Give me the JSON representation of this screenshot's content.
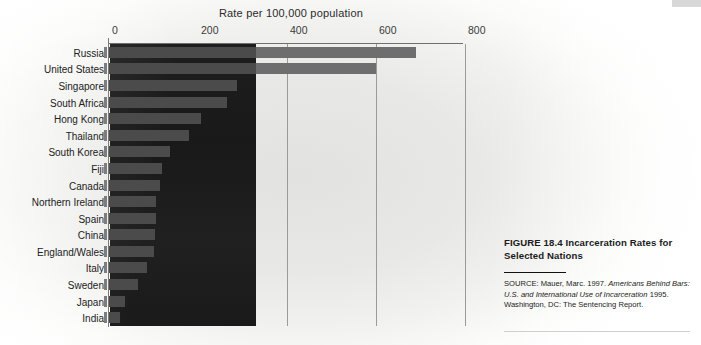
{
  "figure": {
    "axis_title": "Rate per 100,000 population",
    "caption_title": "FIGURE 18.4  Incarceration Rates for Selected Nations",
    "source_label": "SOURCE:",
    "source_text_1": "Mauer, Marc. 1997.",
    "source_text_italic_1": "Americans Behind Bars: U.S. and International Use of Incarceration",
    "source_text_2": "1995. Washington, DC: The Sentencing Report."
  },
  "colors": {
    "bar": "#6e6e6e",
    "bar_dimmed": "#4b4b4b",
    "overlay": "#1c1c1c",
    "gridline": "#9a9a9a",
    "paper": "#e8e8e6"
  },
  "chart_data": {
    "type": "bar",
    "orientation": "horizontal",
    "title": "Rate per 100,000 population",
    "xlabel": "Rate per 100,000 population",
    "ylabel": "",
    "xlim": [
      0,
      800
    ],
    "xticks": [
      0,
      200,
      400,
      600,
      800
    ],
    "xtick_labels": [
      "0",
      "200",
      "400",
      "600",
      "800"
    ],
    "grid": true,
    "legend": "none",
    "categories": [
      "Russia",
      "United States",
      "Singapore",
      "South Africa",
      "Hong Kong",
      "Thailand",
      "South Korea",
      "Fiji",
      "Canada",
      "Northern Ireland",
      "Spain",
      "China",
      "England/Wales",
      "Italy",
      "Sweden",
      "Japan",
      "India"
    ],
    "values": [
      690,
      600,
      287,
      265,
      207,
      180,
      137,
      118,
      115,
      105,
      105,
      103,
      100,
      85,
      65,
      36,
      24
    ],
    "annotations": [
      "A dark rectangular ink block overlays the plot area from 0 to about 330 on the value axis."
    ]
  }
}
